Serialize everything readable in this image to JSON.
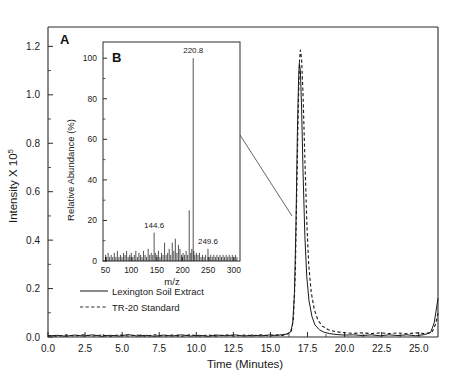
{
  "figure": {
    "panels": [
      {
        "letter": "A",
        "name": "chromatogram"
      },
      {
        "letter": "B",
        "name": "mass-spectrum-inset"
      }
    ]
  },
  "main_axes": {
    "xlabel": "Time (Minutes)",
    "ylabel_main": "Intensity X 10",
    "ylabel_exponent": "5",
    "xticks": [
      "0.0",
      "2.5",
      "5.0",
      "7.5",
      "10.0",
      "12.5",
      "15.0",
      "17.5",
      "20.0",
      "22.5",
      "25.0"
    ],
    "yticks": [
      "0.0",
      "0.2",
      "0.4",
      "0.6",
      "0.8",
      "1.0",
      "1.2"
    ]
  },
  "legend": {
    "items": [
      {
        "label": "Lexington Soil Extract",
        "style": "solid"
      },
      {
        "label": "TR-20 Standard",
        "style": "dashed"
      }
    ]
  },
  "inset_axes": {
    "xlabel": "m/z",
    "ylabel": "Relative Abundance (%)",
    "xticks": [
      "50",
      "100",
      "150",
      "200",
      "250",
      "300"
    ],
    "yticks": [
      "0",
      "20",
      "40",
      "60",
      "80",
      "100"
    ]
  },
  "inset_peak_labels": [
    {
      "text": "144.6",
      "mz": 144.6
    },
    {
      "text": "220.8",
      "mz": 220.8
    },
    {
      "text": "249.6",
      "mz": 249.6
    }
  ],
  "chart_data": {
    "type": "line",
    "title": "",
    "panels": [
      {
        "id": "A",
        "type": "line",
        "xlabel": "Time (Minutes)",
        "ylabel": "Intensity X 10^5",
        "xlim": [
          0.0,
          26.3
        ],
        "ylim": [
          0.0,
          1.28
        ],
        "xticks": [
          0.0,
          2.5,
          5.0,
          7.5,
          10.0,
          12.5,
          15.0,
          17.5,
          20.0,
          22.5,
          25.0
        ],
        "yticks": [
          0.0,
          0.2,
          0.4,
          0.6,
          0.8,
          1.0,
          1.2
        ],
        "grid": false,
        "legend_position": "lower-left-inside",
        "series": [
          {
            "name": "Lexington Soil Extract",
            "style": "solid",
            "peak_time": 16.95,
            "peak_height": 1.13,
            "points": [
              [
                0.0,
                0.004
              ],
              [
                0.6,
                0.007
              ],
              [
                1.2,
                0.003
              ],
              [
                1.8,
                0.008
              ],
              [
                2.4,
                0.004
              ],
              [
                3.0,
                0.009
              ],
              [
                3.6,
                0.003
              ],
              [
                4.2,
                0.007
              ],
              [
                4.8,
                0.004
              ],
              [
                5.4,
                0.01
              ],
              [
                6.0,
                0.004
              ],
              [
                6.6,
                0.007
              ],
              [
                7.2,
                0.003
              ],
              [
                7.8,
                0.008
              ],
              [
                8.4,
                0.004
              ],
              [
                9.0,
                0.009
              ],
              [
                9.6,
                0.004
              ],
              [
                10.2,
                0.007
              ],
              [
                10.8,
                0.003
              ],
              [
                11.4,
                0.008
              ],
              [
                12.0,
                0.005
              ],
              [
                12.6,
                0.009
              ],
              [
                13.2,
                0.004
              ],
              [
                13.8,
                0.007
              ],
              [
                14.4,
                0.005
              ],
              [
                15.0,
                0.009
              ],
              [
                15.4,
                0.006
              ],
              [
                15.8,
                0.01
              ],
              [
                16.1,
                0.012
              ],
              [
                16.35,
                0.02
              ],
              [
                16.5,
                0.055
              ],
              [
                16.62,
                0.18
              ],
              [
                16.72,
                0.46
              ],
              [
                16.82,
                0.85
              ],
              [
                16.9,
                1.07
              ],
              [
                16.95,
                1.13
              ],
              [
                17.02,
                1.1
              ],
              [
                17.1,
                0.95
              ],
              [
                17.2,
                0.68
              ],
              [
                17.32,
                0.42
              ],
              [
                17.45,
                0.25
              ],
              [
                17.6,
                0.15
              ],
              [
                17.8,
                0.085
              ],
              [
                18.0,
                0.05
              ],
              [
                18.3,
                0.03
              ],
              [
                18.6,
                0.02
              ],
              [
                19.0,
                0.014
              ],
              [
                19.5,
                0.01
              ],
              [
                20.0,
                0.008
              ],
              [
                20.6,
                0.009
              ],
              [
                21.2,
                0.006
              ],
              [
                21.8,
                0.009
              ],
              [
                22.4,
                0.005
              ],
              [
                23.0,
                0.009
              ],
              [
                23.6,
                0.006
              ],
              [
                24.2,
                0.009
              ],
              [
                24.8,
                0.005
              ],
              [
                25.4,
                0.01
              ],
              [
                25.8,
                0.018
              ],
              [
                26.05,
                0.06
              ],
              [
                26.2,
                0.12
              ],
              [
                26.3,
                0.16
              ]
            ]
          },
          {
            "name": "TR-20 Standard",
            "style": "dashed",
            "peak_time": 17.02,
            "peak_height": 1.185,
            "points": [
              [
                0.0,
                0.006
              ],
              [
                0.6,
                0.003
              ],
              [
                1.2,
                0.008
              ],
              [
                1.8,
                0.004
              ],
              [
                2.4,
                0.009
              ],
              [
                3.0,
                0.004
              ],
              [
                3.6,
                0.008
              ],
              [
                4.2,
                0.003
              ],
              [
                4.8,
                0.009
              ],
              [
                5.4,
                0.004
              ],
              [
                6.0,
                0.008
              ],
              [
                6.6,
                0.003
              ],
              [
                7.2,
                0.009
              ],
              [
                7.8,
                0.004
              ],
              [
                8.4,
                0.008
              ],
              [
                9.0,
                0.003
              ],
              [
                9.6,
                0.009
              ],
              [
                10.2,
                0.004
              ],
              [
                10.8,
                0.008
              ],
              [
                11.4,
                0.004
              ],
              [
                12.0,
                0.009
              ],
              [
                12.6,
                0.004
              ],
              [
                13.2,
                0.008
              ],
              [
                13.8,
                0.005
              ],
              [
                14.4,
                0.009
              ],
              [
                15.0,
                0.004
              ],
              [
                15.4,
                0.009
              ],
              [
                15.8,
                0.006
              ],
              [
                16.1,
                0.011
              ],
              [
                16.4,
                0.022
              ],
              [
                16.55,
                0.075
              ],
              [
                16.68,
                0.27
              ],
              [
                16.78,
                0.62
              ],
              [
                16.88,
                0.95
              ],
              [
                16.96,
                1.14
              ],
              [
                17.02,
                1.185
              ],
              [
                17.1,
                1.15
              ],
              [
                17.2,
                1.0
              ],
              [
                17.32,
                0.74
              ],
              [
                17.45,
                0.48
              ],
              [
                17.58,
                0.3
              ],
              [
                17.75,
                0.185
              ],
              [
                17.95,
                0.115
              ],
              [
                18.2,
                0.07
              ],
              [
                18.5,
                0.045
              ],
              [
                18.9,
                0.03
              ],
              [
                19.4,
                0.022
              ],
              [
                20.0,
                0.018
              ],
              [
                20.6,
                0.015
              ],
              [
                21.2,
                0.017
              ],
              [
                21.8,
                0.014
              ],
              [
                22.4,
                0.017
              ],
              [
                23.0,
                0.014
              ],
              [
                23.6,
                0.017
              ],
              [
                24.2,
                0.013
              ],
              [
                24.8,
                0.017
              ],
              [
                25.4,
                0.014
              ],
              [
                25.9,
                0.02
              ],
              [
                26.15,
                0.055
              ],
              [
                26.3,
                0.1
              ]
            ]
          }
        ]
      },
      {
        "id": "B",
        "type": "bar",
        "xlabel": "m/z",
        "ylabel": "Relative Abundance (%)",
        "xlim": [
          45,
          312
        ],
        "ylim": [
          0,
          108
        ],
        "xticks": [
          50,
          100,
          150,
          200,
          250,
          300
        ],
        "yticks": [
          0,
          20,
          40,
          60,
          80,
          100
        ],
        "grid": false,
        "base_peak": {
          "mz": 220.8,
          "abundance": 100
        },
        "labeled_peaks": [
          {
            "mz": 144.6,
            "abundance": 14
          },
          {
            "mz": 220.8,
            "abundance": 100
          },
          {
            "mz": 249.6,
            "abundance": 6
          }
        ],
        "peaks": [
          [
            50,
            3
          ],
          [
            52,
            2
          ],
          [
            55,
            4
          ],
          [
            58,
            2
          ],
          [
            61,
            3
          ],
          [
            64,
            2
          ],
          [
            67,
            4
          ],
          [
            70,
            2
          ],
          [
            73,
            5
          ],
          [
            76,
            2
          ],
          [
            79,
            3
          ],
          [
            82,
            2
          ],
          [
            85,
            4
          ],
          [
            88,
            3
          ],
          [
            91,
            5
          ],
          [
            94,
            2
          ],
          [
            97,
            3
          ],
          [
            100,
            4
          ],
          [
            103,
            2
          ],
          [
            106,
            3
          ],
          [
            109,
            5
          ],
          [
            112,
            2
          ],
          [
            115,
            4
          ],
          [
            118,
            3
          ],
          [
            121,
            2
          ],
          [
            124,
            5
          ],
          [
            127,
            3
          ],
          [
            130,
            2
          ],
          [
            133,
            6
          ],
          [
            136,
            3
          ],
          [
            139,
            4
          ],
          [
            142,
            3
          ],
          [
            144.6,
            14
          ],
          [
            147,
            4
          ],
          [
            150,
            3
          ],
          [
            153,
            5
          ],
          [
            156,
            2
          ],
          [
            159,
            4
          ],
          [
            162,
            3
          ],
          [
            165,
            9
          ],
          [
            168,
            3
          ],
          [
            171,
            4
          ],
          [
            174,
            6
          ],
          [
            177,
            3
          ],
          [
            180,
            9
          ],
          [
            183,
            5
          ],
          [
            186,
            11
          ],
          [
            189,
            4
          ],
          [
            192,
            8
          ],
          [
            195,
            6
          ],
          [
            198,
            3
          ],
          [
            201,
            4
          ],
          [
            204,
            3
          ],
          [
            207,
            5
          ],
          [
            210,
            3
          ],
          [
            213,
            25
          ],
          [
            216,
            4
          ],
          [
            218,
            6
          ],
          [
            220.8,
            100
          ],
          [
            222,
            5
          ],
          [
            224,
            3
          ],
          [
            227,
            4
          ],
          [
            230,
            3
          ],
          [
            233,
            4
          ],
          [
            236,
            2
          ],
          [
            239,
            3
          ],
          [
            242,
            2
          ],
          [
            245,
            3
          ],
          [
            249.6,
            6
          ],
          [
            252,
            2
          ],
          [
            255,
            3
          ],
          [
            258,
            2
          ],
          [
            261,
            3
          ],
          [
            264,
            2
          ],
          [
            267,
            3
          ],
          [
            270,
            2
          ],
          [
            273,
            3
          ],
          [
            276,
            2
          ],
          [
            279,
            3
          ],
          [
            282,
            2
          ],
          [
            285,
            3
          ],
          [
            288,
            2
          ],
          [
            291,
            3
          ],
          [
            294,
            2
          ],
          [
            297,
            3
          ],
          [
            300,
            2
          ],
          [
            303,
            3
          ],
          [
            306,
            2
          ]
        ]
      }
    ]
  }
}
